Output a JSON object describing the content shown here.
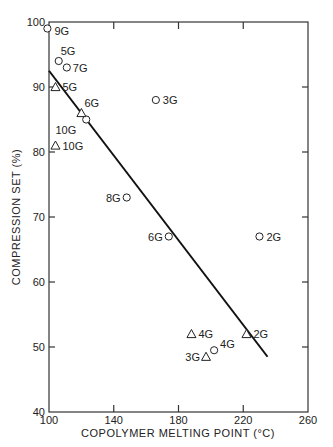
{
  "chart_data": {
    "type": "scatter",
    "title": "",
    "xlabel": "COPOLYMER MELTING POINT (°C)",
    "ylabel": "COMPRESSION SET (%)",
    "xlim": [
      100,
      260
    ],
    "ylim": [
      40,
      100
    ],
    "xticks": [
      100,
      140,
      180,
      220,
      260
    ],
    "yticks": [
      40,
      50,
      60,
      70,
      80,
      90,
      100
    ],
    "grid": false,
    "legend": null,
    "series": [
      {
        "name": "circles",
        "marker": "circle",
        "points": [
          {
            "x": 99,
            "y": 99,
            "label": "9G"
          },
          {
            "x": 106,
            "y": 94,
            "label": "5G"
          },
          {
            "x": 111,
            "y": 93,
            "label": "7G"
          },
          {
            "x": 123,
            "y": 85,
            "label": "10G"
          },
          {
            "x": 166,
            "y": 88,
            "label": "3G"
          },
          {
            "x": 148,
            "y": 73,
            "label": "8G"
          },
          {
            "x": 174,
            "y": 67,
            "label": "6G"
          },
          {
            "x": 230,
            "y": 67,
            "label": "2G"
          },
          {
            "x": 202,
            "y": 49.5,
            "label": "4G"
          }
        ]
      },
      {
        "name": "triangles",
        "marker": "triangle",
        "points": [
          {
            "x": 104,
            "y": 90,
            "label": "5G"
          },
          {
            "x": 120,
            "y": 86,
            "label": "6G"
          },
          {
            "x": 104,
            "y": 81,
            "label": "10G"
          },
          {
            "x": 188,
            "y": 52,
            "label": "4G"
          },
          {
            "x": 222,
            "y": 52,
            "label": "2G"
          },
          {
            "x": 197,
            "y": 48.5,
            "label": "3G"
          }
        ]
      }
    ],
    "fit_line": {
      "x": [
        100,
        235
      ],
      "y": [
        92.5,
        48.5
      ]
    }
  }
}
